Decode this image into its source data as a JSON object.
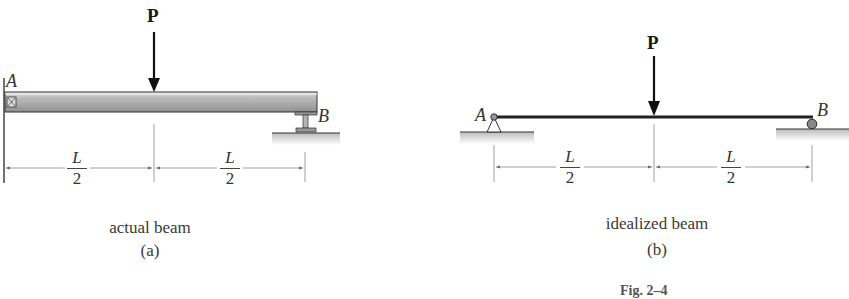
{
  "figure": {
    "label": "Fig. 2–4",
    "panels": [
      {
        "id": "a",
        "caption": "actual beam",
        "sublabel": "(a)",
        "load_label": "P",
        "left_point": "A",
        "right_point": "B",
        "left_support": "fixed wall connection",
        "right_support": "I-beam column support",
        "dimensions": [
          {
            "numerator": "L",
            "denominator": "2"
          },
          {
            "numerator": "L",
            "denominator": "2"
          }
        ]
      },
      {
        "id": "b",
        "caption": "idealized beam",
        "sublabel": "(b)",
        "load_label": "P",
        "left_point": "A",
        "right_point": "B",
        "left_support": "pin",
        "right_support": "roller",
        "dimensions": [
          {
            "numerator": "L",
            "denominator": "2"
          },
          {
            "numerator": "L",
            "denominator": "2"
          }
        ]
      }
    ]
  },
  "colors": {
    "beam_fill": "#a9a9a9",
    "beam_dark": "#555555",
    "line": "#222222",
    "ground_shadow": "#c8c8c8",
    "dim_line": "#777777"
  }
}
